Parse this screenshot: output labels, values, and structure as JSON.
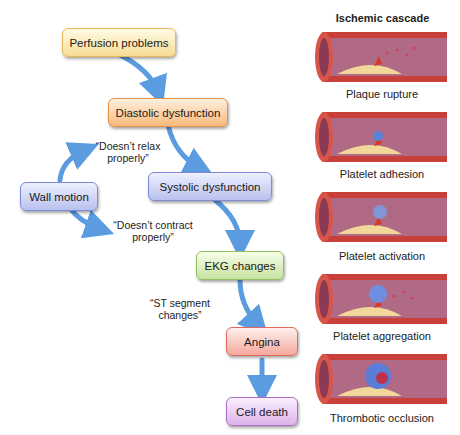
{
  "flow": {
    "nodes": [
      {
        "id": "perfusion",
        "label": "Perfusion problems",
        "color": "yellow"
      },
      {
        "id": "diastolic",
        "label": "Diastolic dysfunction",
        "color": "orange"
      },
      {
        "id": "systolic",
        "label": "Systolic dysfunction",
        "color": "blue"
      },
      {
        "id": "wall",
        "label": "Wall motion",
        "color": "blue"
      },
      {
        "id": "ekg",
        "label": "EKG changes",
        "color": "green"
      },
      {
        "id": "angina",
        "label": "Angina",
        "color": "red"
      },
      {
        "id": "death",
        "label": "Cell death",
        "color": "purple"
      }
    ],
    "annotations": {
      "relax_1": "“Doesn’t relax",
      "relax_2": "properly”",
      "contract_1": "“Doesn’t contract",
      "contract_2": "properly”",
      "st_1": "“ST segment",
      "st_2": "changes”"
    },
    "arrow_color": "#5b9be0"
  },
  "cascade": {
    "title": "Ischemic cascade",
    "stages": [
      {
        "label": "Plaque rupture"
      },
      {
        "label": "Platelet adhesion"
      },
      {
        "label": "Platelet activation"
      },
      {
        "label": "Platelet aggregation"
      },
      {
        "label": "Thrombotic occlusion"
      }
    ]
  }
}
